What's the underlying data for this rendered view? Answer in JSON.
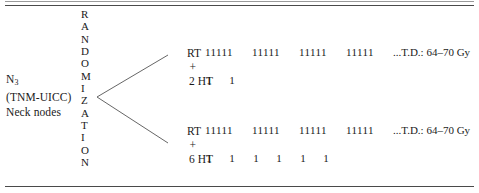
{
  "figure": {
    "left_label": {
      "stage": "N",
      "stage_subscript": "3",
      "classification": "(TNM-UICC)",
      "site": "Neck nodes"
    },
    "randomization": {
      "word": "RANDOMIZATION",
      "letters": [
        "R",
        "A",
        "N",
        "D",
        "O",
        "M",
        "I",
        "Z",
        "A",
        "T",
        "I",
        "O",
        "N"
      ]
    },
    "arms": [
      {
        "id": "upper-arm",
        "treatment": "RT",
        "operator": "+",
        "adjuvant": "2 HT",
        "fraction_groups": [
          "11111",
          "11111",
          "11111",
          "11111"
        ],
        "dose_text": "...T.D.: 64–70 Gy",
        "ht_marks": [
          "1",
          "1"
        ],
        "ht_mark_offsets": [
          0,
          23
        ]
      },
      {
        "id": "lower-arm",
        "treatment": "RT",
        "operator": "+",
        "adjuvant": "6 HT",
        "fraction_groups": [
          "11111",
          "11111",
          "11111",
          "11111"
        ],
        "dose_text": "...T.D.: 64–70 Gy",
        "ht_marks": [
          "1",
          "1",
          "1",
          "1",
          "1",
          "1"
        ],
        "ht_mark_offsets": [
          0,
          23,
          47,
          70,
          94,
          117
        ]
      }
    ],
    "colors": {
      "background": "#ffffff",
      "text": "#1a1a1a",
      "rule": "#4a4a4a",
      "branch_line": "#555555"
    }
  }
}
